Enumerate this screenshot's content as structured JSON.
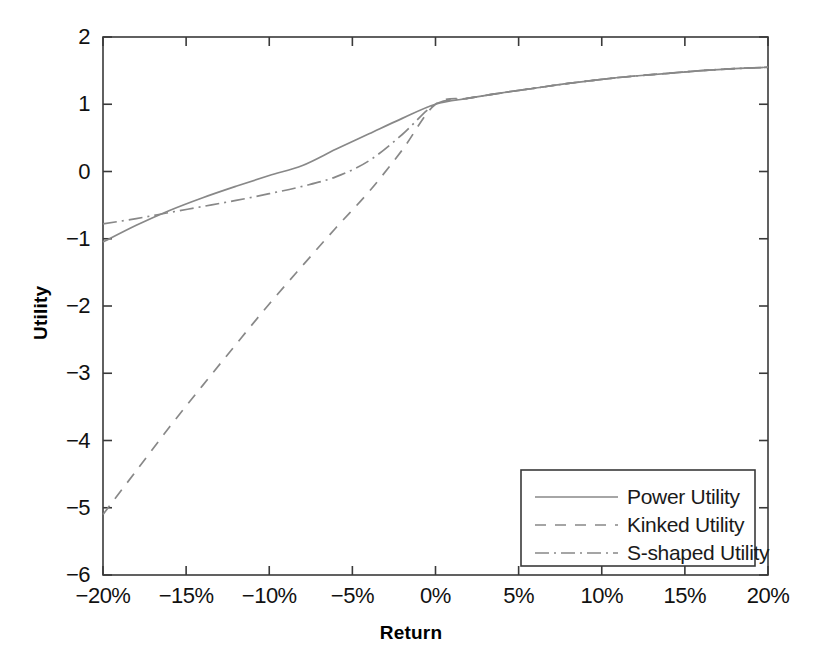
{
  "chart_data": {
    "type": "line",
    "title": "",
    "xlabel": "Return",
    "ylabel": "Utility",
    "xlim": [
      -20,
      20
    ],
    "ylim": [
      -6,
      2
    ],
    "grid": false,
    "x_tick_labels": [
      "−20%",
      "−15%",
      "−10%",
      "−5%",
      "0%",
      "5%",
      "10%",
      "15%",
      "20%"
    ],
    "x_tick_values": [
      -20,
      -15,
      -10,
      -5,
      0,
      5,
      10,
      15,
      20
    ],
    "y_tick_labels": [
      "2",
      "1",
      "0",
      "−1",
      "−2",
      "−3",
      "−4",
      "−5",
      "−6"
    ],
    "y_tick_values": [
      2,
      1,
      0,
      -1,
      -2,
      -3,
      -4,
      -5,
      -6
    ],
    "legend_position": "lower right",
    "line_color": "#888888",
    "axis_color": "#3a3a3a",
    "series": [
      {
        "name": "Power Utility",
        "dash": "solid",
        "x": [
          -20,
          -18,
          -16,
          -14,
          -12,
          -10,
          -8,
          -6,
          -4,
          -2,
          0,
          2,
          4,
          6,
          8,
          10,
          12,
          14,
          16,
          18,
          20
        ],
        "values": [
          -1.05,
          -0.8,
          -0.58,
          -0.39,
          -0.22,
          -0.06,
          0.09,
          0.33,
          0.56,
          0.79,
          1.0,
          1.09,
          1.17,
          1.24,
          1.31,
          1.37,
          1.42,
          1.46,
          1.5,
          1.53,
          1.55
        ]
      },
      {
        "name": "Kinked Utility",
        "dash": "dashed",
        "x": [
          -20,
          -18,
          -16,
          -14,
          -12,
          -10,
          -8,
          -6,
          -4,
          -2,
          0,
          2,
          4,
          6,
          8,
          10,
          12,
          14,
          16,
          18,
          20
        ],
        "values": [
          -5.1,
          -4.45,
          -3.8,
          -3.18,
          -2.57,
          -1.97,
          -1.4,
          -0.84,
          -0.3,
          0.32,
          1.0,
          1.09,
          1.17,
          1.24,
          1.31,
          1.37,
          1.42,
          1.46,
          1.5,
          1.53,
          1.55
        ]
      },
      {
        "name": "S-shaped Utility",
        "dash": "dashdot",
        "x": [
          -20,
          -18,
          -16,
          -14,
          -12,
          -10,
          -8,
          -6,
          -4,
          -2,
          0,
          2,
          4,
          6,
          8,
          10,
          12,
          14,
          16,
          18,
          20
        ],
        "values": [
          -0.78,
          -0.7,
          -0.61,
          -0.52,
          -0.43,
          -0.33,
          -0.22,
          -0.08,
          0.16,
          0.55,
          1.0,
          1.09,
          1.17,
          1.24,
          1.31,
          1.37,
          1.42,
          1.46,
          1.5,
          1.53,
          1.55
        ]
      }
    ]
  },
  "axis_labels": {
    "x": "Return",
    "y": "Utility"
  },
  "legend": {
    "items": [
      {
        "label": "Power Utility"
      },
      {
        "label": "Kinked Utility"
      },
      {
        "label": "S-shaped Utility"
      }
    ]
  }
}
